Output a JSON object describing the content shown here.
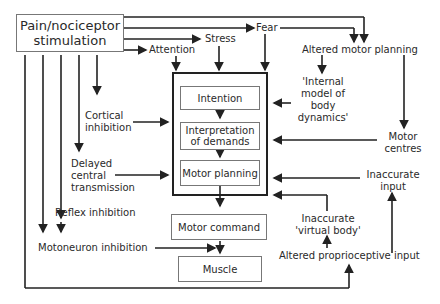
{
  "source": {
    "line1": "Pain/nociceptor",
    "line2": "stimulation"
  },
  "top_labels": {
    "attention": "Attention",
    "stress": "Stress",
    "fear": "Fear",
    "altered_motor_planning": "Altered motor planning"
  },
  "internal_model": {
    "line1": "'Internal",
    "line2": "model of",
    "line3": "body",
    "line4": "dynamics'"
  },
  "motor_centres": {
    "line1": "Motor",
    "line2": "centres"
  },
  "inaccurate_input": {
    "line1": "Inaccurate",
    "line2": "input"
  },
  "inaccurate_virtual_body": {
    "line1": "Inaccurate",
    "line2": "'virtual body'"
  },
  "altered_proprioceptive_input": "Altered proprioceptive input",
  "left_labels": {
    "cortical_inhibition": {
      "line1": "Cortical",
      "line2": "inhibition"
    },
    "delayed_central": {
      "line1": "Delayed",
      "line2": "central",
      "line3": "transmission"
    },
    "reflex_inhibition": "Reflex inhibition",
    "motoneuron_inhibition": "Motoneuron inhibition"
  },
  "central_boxes": {
    "intention": "Intention",
    "interpretation": {
      "line1": "Interpretation",
      "line2": "of demands"
    },
    "motor_planning": "Motor planning",
    "motor_command": "Motor command",
    "muscle": "Muscle"
  }
}
